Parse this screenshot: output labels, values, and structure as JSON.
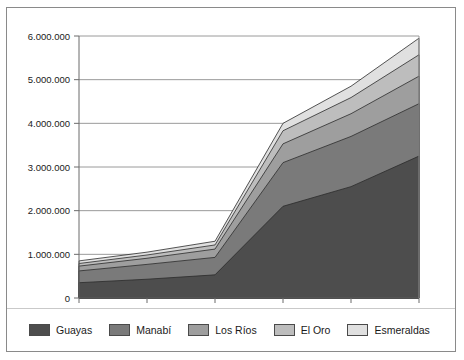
{
  "chart_data": {
    "type": "area",
    "stacked": true,
    "title": "",
    "xlabel": "",
    "ylabel": "",
    "categories": [
      "1935",
      "1946",
      "1950",
      "1982",
      "1990",
      "1996"
    ],
    "ylim": [
      0,
      6000000
    ],
    "yticks": [
      0,
      1000000,
      2000000,
      3000000,
      4000000,
      5000000,
      6000000
    ],
    "ytick_labels": [
      "0",
      "1.000.000",
      "2.000.000",
      "3.000.000",
      "4.000.000",
      "5.000.000",
      "6.000.000"
    ],
    "grid": true,
    "legend_position": "bottom",
    "number_format": "european-dot-thousands",
    "series": [
      {
        "name": "Guayas",
        "color": "#4d4d4d",
        "values": [
          350000,
          430000,
          530000,
          2100000,
          2550000,
          3250000
        ]
      },
      {
        "name": "Manabí",
        "color": "#7a7a7a",
        "values": [
          270000,
          340000,
          400000,
          1000000,
          1150000,
          1200000
        ]
      },
      {
        "name": "Los Ríos",
        "color": "#9e9e9e",
        "values": [
          110000,
          140000,
          190000,
          430000,
          520000,
          630000
        ]
      },
      {
        "name": "El Oro",
        "color": "#bdbdbd",
        "values": [
          60000,
          75000,
          95000,
          300000,
          370000,
          490000
        ]
      },
      {
        "name": "Esmeraldas",
        "color": "#e0e0e0",
        "values": [
          60000,
          65000,
          85000,
          170000,
          260000,
          380000
        ]
      }
    ],
    "cumulative_totals": [
      850000,
      1050000,
      1300000,
      4000000,
      4850000,
      5950000
    ]
  },
  "legend": {
    "items": [
      {
        "label": "Guayas"
      },
      {
        "label": "Manabí"
      },
      {
        "label": "Los Ríos"
      },
      {
        "label": "El Oro"
      },
      {
        "label": "Esmeraldas"
      }
    ]
  }
}
